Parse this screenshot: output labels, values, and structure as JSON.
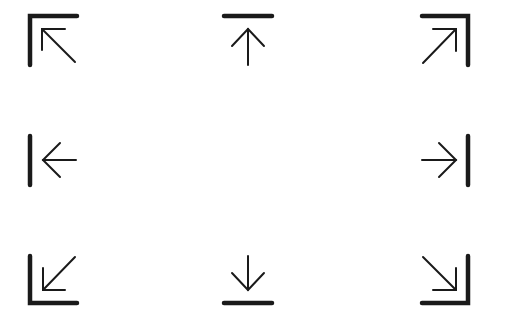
{
  "icons": [
    {
      "name": "align-top-left-icon",
      "direction": "up-left",
      "row": 0,
      "col": 0
    },
    {
      "name": "align-top-icon",
      "direction": "up",
      "row": 0,
      "col": 1
    },
    {
      "name": "align-top-right-icon",
      "direction": "up-right",
      "row": 0,
      "col": 2
    },
    {
      "name": "align-left-icon",
      "direction": "left",
      "row": 1,
      "col": 0
    },
    {
      "name": "align-right-icon",
      "direction": "right",
      "row": 1,
      "col": 2
    },
    {
      "name": "align-bottom-left-icon",
      "direction": "down-left",
      "row": 2,
      "col": 0
    },
    {
      "name": "align-bottom-icon",
      "direction": "down",
      "row": 2,
      "col": 1
    },
    {
      "name": "align-bottom-right-icon",
      "direction": "down-right",
      "row": 2,
      "col": 2
    }
  ],
  "colors": {
    "stroke": "#1a1a1a",
    "background": "#ffffff"
  }
}
